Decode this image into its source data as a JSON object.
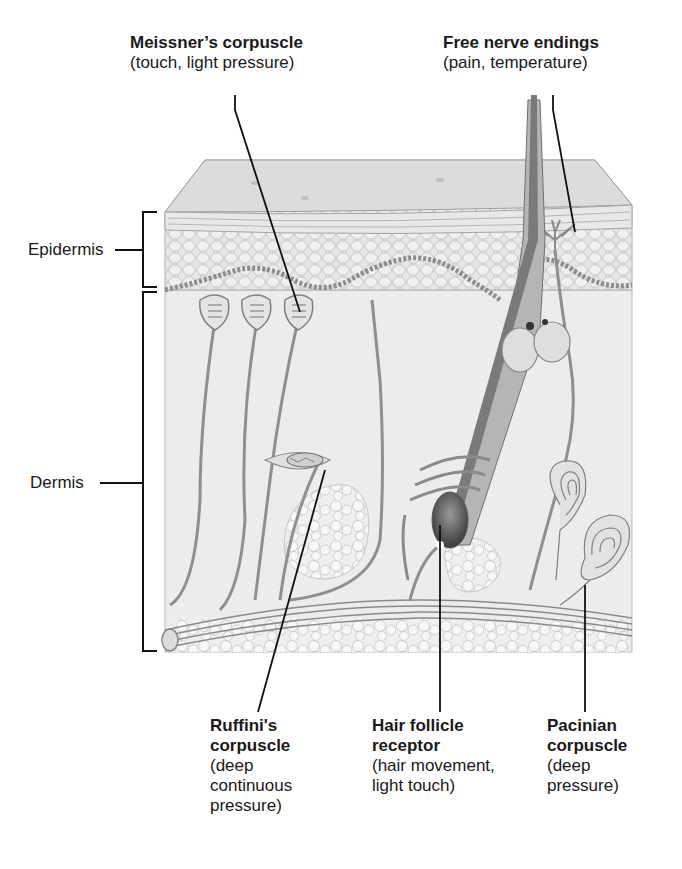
{
  "diagram": {
    "layers": [
      {
        "id": "epidermis",
        "label": "Epidermis"
      },
      {
        "id": "dermis",
        "label": "Dermis"
      }
    ],
    "receptors": [
      {
        "id": "meissner",
        "name": "Meissner’s corpuscle",
        "function": "(touch, light pressure)"
      },
      {
        "id": "free-nerve",
        "name": "Free nerve endings",
        "function": "(pain, temperature)"
      },
      {
        "id": "ruffini",
        "name_line1": "Ruffini's",
        "name_line2": "corpuscle",
        "function_lines": [
          "(deep",
          "continuous",
          "pressure)"
        ]
      },
      {
        "id": "hair-follicle",
        "name_line1": "Hair follicle",
        "name_line2": "receptor",
        "function_lines": [
          "(hair movement,",
          "light touch)"
        ]
      },
      {
        "id": "pacinian",
        "name_line1": "Pacinian",
        "name_line2": "corpuscle",
        "function_lines": [
          "(deep",
          "pressure)"
        ]
      }
    ]
  },
  "colors": {
    "background": "#ffffff",
    "skin_surface": "#dcdcdc",
    "tissue": "#ebebeb",
    "nerve": "#8a8a8a",
    "hair": "#6a6a6a",
    "leader_line": "#111111"
  }
}
